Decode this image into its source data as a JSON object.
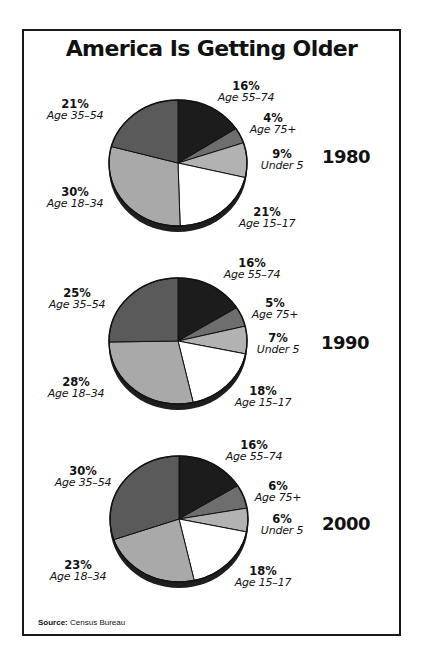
{
  "title": "America Is Getting Older",
  "source": {
    "label": "Source:",
    "text": "Census Bureau"
  },
  "colors": {
    "Age 55–74": "#1c1c1c",
    "Age 75+": "#6e6e6e",
    "Under 5": "#b2b2b2",
    "Age 15–17": "#ffffff",
    "Age 18–34": "#a9a9a9",
    "Age 35–54": "#5a5a5a",
    "rim": "#1e1e1e",
    "outline": "#111111"
  },
  "chart_data": [
    {
      "type": "pie",
      "title": "1980",
      "categories": [
        "Age 55–74",
        "Age 75+",
        "Under 5",
        "Age 15–17",
        "Age 18–34",
        "Age 35–54"
      ],
      "values": [
        16,
        4,
        9,
        21,
        30,
        21
      ],
      "labels": [
        "16%",
        "4%",
        "9%",
        "21%",
        "30%",
        "21%"
      ]
    },
    {
      "type": "pie",
      "title": "1990",
      "categories": [
        "Age 55–74",
        "Age 75+",
        "Under 5",
        "Age 15–17",
        "Age 18–34",
        "Age 35–54"
      ],
      "values": [
        16,
        5,
        7,
        18,
        28,
        25
      ],
      "labels": [
        "16%",
        "5%",
        "7%",
        "18%",
        "28%",
        "25%"
      ]
    },
    {
      "type": "pie",
      "title": "2000",
      "categories": [
        "Age 55–74",
        "Age 75+",
        "Under 5",
        "Age 15–17",
        "Age 18–34",
        "Age 35–54"
      ],
      "values": [
        16,
        6,
        6,
        18,
        23,
        30
      ],
      "labels": [
        "16%",
        "6%",
        "6%",
        "18%",
        "23%",
        "30%"
      ]
    }
  ],
  "pies": [
    {
      "year": "1980",
      "slices": [
        {
          "pct": "16%",
          "group": "Age 55–74"
        },
        {
          "pct": "4%",
          "group": "Age 75+"
        },
        {
          "pct": "9%",
          "group": "Under 5"
        },
        {
          "pct": "21%",
          "group": "Age 15–17"
        },
        {
          "pct": "30%",
          "group": "Age 18–34"
        },
        {
          "pct": "21%",
          "group": "Age 35–54"
        }
      ]
    },
    {
      "year": "1990",
      "slices": [
        {
          "pct": "16%",
          "group": "Age 55–74"
        },
        {
          "pct": "5%",
          "group": "Age 75+"
        },
        {
          "pct": "7%",
          "group": "Under 5"
        },
        {
          "pct": "18%",
          "group": "Age 15–17"
        },
        {
          "pct": "28%",
          "group": "Age 18–34"
        },
        {
          "pct": "25%",
          "group": "Age 35–54"
        }
      ]
    },
    {
      "year": "2000",
      "slices": [
        {
          "pct": "16%",
          "group": "Age 55–74"
        },
        {
          "pct": "6%",
          "group": "Age 75+"
        },
        {
          "pct": "6%",
          "group": "Under 5"
        },
        {
          "pct": "18%",
          "group": "Age 15–17"
        },
        {
          "pct": "23%",
          "group": "Age 18–34"
        },
        {
          "pct": "30%",
          "group": "Age 35–54"
        }
      ]
    }
  ]
}
